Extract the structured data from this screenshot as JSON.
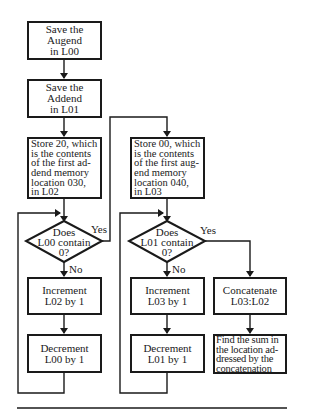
{
  "flowchart": {
    "left_column": {
      "save_augend": "Save the\nAugend\nin L00",
      "save_addend": "Save the\nAddend\nin L01",
      "store_20": "Store 20, which\nis the contents\nof the first ad-\ndend memory\nlocation 030,\nin L02",
      "decision": "Does\nL00 contain\n0?",
      "decision_yes": "Yes",
      "decision_no": "No",
      "increment": "Increment\nL02 by 1",
      "decrement": "Decrement\nL00 by 1"
    },
    "middle_column": {
      "store_00": "Store 00, which\nis the contents\nof the first aug-\nend memory\nlocation 040,\nin L03",
      "decision": "Does\nL01 contain\n0?",
      "decision_yes": "Yes",
      "decision_no": "No",
      "increment": "Increment\nL03 by 1",
      "decrement": "Decrement\nL01 by 1"
    },
    "right_column": {
      "concatenate": "Concatenate\nL03:L02",
      "find_sum": "Find the sum in\nthe location ad-\ndressed by the\nconcatenation"
    }
  }
}
